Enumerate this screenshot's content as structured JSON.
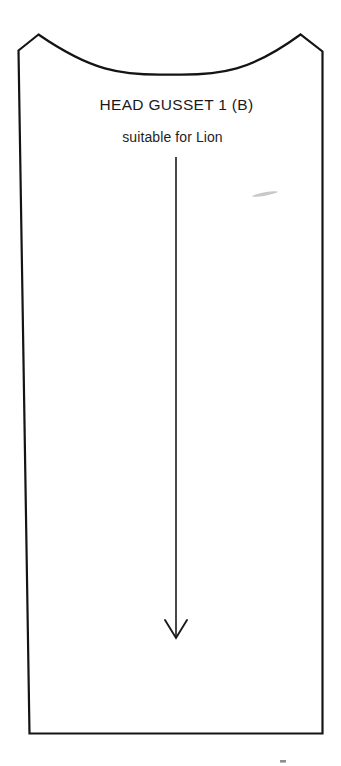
{
  "document": {
    "kind": "sewing-pattern-piece",
    "background_color": "#ffffff",
    "ink_color": "#1a1a1a"
  },
  "labels": {
    "title": "HEAD GUSSET 1 (B)",
    "subtitle": "suitable for Lion"
  },
  "shape": {
    "name": "head-gusset-panel",
    "stroke_color": "#141414",
    "stroke_width": 2.2,
    "fill": "none",
    "outline_path": "M 18.5 50.5 L 38.5 34.5 C 90 70 120 76 170.5 74.5 C 222 76 252 70 300.5 34.5 L 322.5 51.5 L 322.5 733.5 L 29.5 733.5 Z",
    "description": "tall tapering rectangle with concave scooped top edge and peaked top corners",
    "top_left_peak": [
      38.5,
      34.5
    ],
    "top_right_peak": [
      300.5,
      34.5
    ],
    "curve_lowest_point": [
      170.5,
      74.5
    ],
    "bottom_left": [
      29.5,
      733.5
    ],
    "bottom_right": [
      322.5,
      733.5
    ]
  },
  "grain_arrow": {
    "name": "grain-line-arrow",
    "stroke_color": "#1a1a1a",
    "stroke_width": 1.6,
    "x": 176,
    "y_start": 157,
    "y_end": 638,
    "head_style": "open-v",
    "head_half_width": 11,
    "head_height": 18,
    "direction": "down"
  },
  "scan_artifacts": [
    {
      "name": "scan-streak-artifact",
      "type": "streak",
      "x": 252,
      "y": 192,
      "width": 26,
      "height": 4,
      "rotation": -10,
      "color": "#c9c9c9"
    },
    {
      "name": "scan-speck-artifact",
      "type": "speck",
      "x": 280,
      "y": 760,
      "width": 6,
      "height": 3,
      "rotation": 0,
      "color": "#8f8f8f"
    }
  ]
}
